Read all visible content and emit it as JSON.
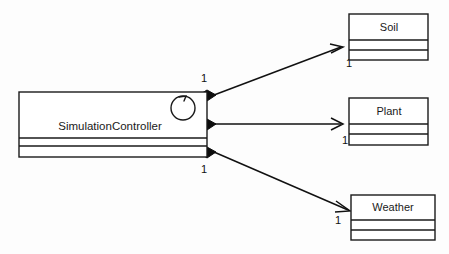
{
  "diagram": {
    "type": "uml-class-diagram",
    "background_color": "#fdfdfd",
    "line_color": "#111111",
    "fill_color": "#ffffff"
  },
  "main_class": {
    "name": "SimulationController",
    "icon": "cyclic-arrow-icon",
    "compartments": [
      "name",
      "attributes",
      "operations"
    ]
  },
  "target_classes": [
    {
      "name": "Soil",
      "multiplicity": "1",
      "compartments": [
        "name",
        "attributes",
        "operations"
      ]
    },
    {
      "name": "Plant",
      "multiplicity": "1",
      "compartments": [
        "name",
        "attributes",
        "operations"
      ]
    },
    {
      "name": "Weather",
      "multiplicity": "1",
      "compartments": [
        "name",
        "attributes",
        "operations"
      ]
    }
  ],
  "associations": [
    {
      "from": "SimulationController",
      "to": "Soil",
      "kind": "composition",
      "source_multiplicity": "1",
      "target_multiplicity": "1"
    },
    {
      "from": "SimulationController",
      "to": "Plant",
      "kind": "composition",
      "source_multiplicity": "1",
      "target_multiplicity": "1"
    },
    {
      "from": "SimulationController",
      "to": "Weather",
      "kind": "composition",
      "source_multiplicity": "1",
      "target_multiplicity": "1"
    }
  ]
}
